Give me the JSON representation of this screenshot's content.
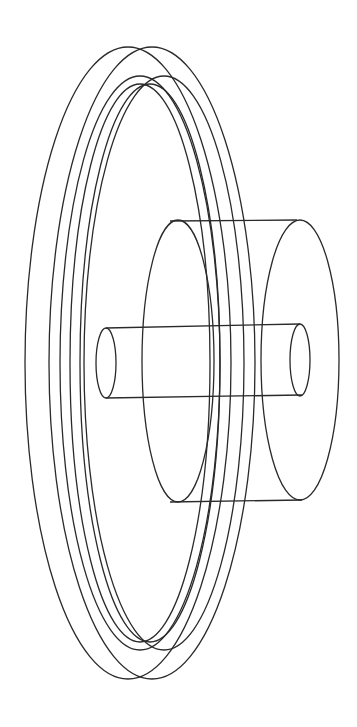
{
  "figure": {
    "stroke_color": "#2a2a2a",
    "background_color": "#ffffff",
    "parts": [
      {
        "name": "pulley-rim",
        "description": "Large flanged wheel shown as four overlapping tall ellipses"
      },
      {
        "name": "pulley-groove",
        "description": "Inner groove ellipses"
      },
      {
        "name": "hub",
        "description": "Cylinder protruding to the right of the wheel"
      },
      {
        "name": "shaft",
        "description": "Slender cylinder passing through the hub"
      }
    ]
  }
}
